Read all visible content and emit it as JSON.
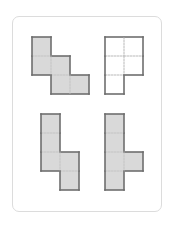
{
  "figure": {
    "cell_size": 19,
    "colors": {
      "card_border": "#dcdcdc",
      "shape_outline": "#6e6e6e",
      "shaded_fill": "#d9d9d9",
      "unshaded_fill": "#ffffff",
      "inner_grid": "#c8c8c8"
    },
    "shapes": [
      {
        "id": "top-left",
        "filled": true,
        "origin": [
          32,
          37
        ],
        "cells": [
          [
            0,
            0
          ],
          [
            0,
            1
          ],
          [
            1,
            1
          ],
          [
            1,
            2
          ],
          [
            2,
            2
          ]
        ]
      },
      {
        "id": "top-right",
        "filled": false,
        "origin": [
          105,
          37
        ],
        "cells": [
          [
            0,
            0
          ],
          [
            1,
            0
          ],
          [
            0,
            1
          ],
          [
            1,
            1
          ],
          [
            0,
            2
          ]
        ]
      },
      {
        "id": "bottom-left",
        "filled": true,
        "origin": [
          41,
          114
        ],
        "cells": [
          [
            0,
            0
          ],
          [
            0,
            1
          ],
          [
            0,
            2
          ],
          [
            1,
            2
          ],
          [
            1,
            3
          ]
        ]
      },
      {
        "id": "bottom-right",
        "filled": true,
        "origin": [
          105,
          114
        ],
        "cells": [
          [
            0,
            0
          ],
          [
            0,
            1
          ],
          [
            0,
            2
          ],
          [
            0,
            3
          ],
          [
            1,
            2
          ]
        ]
      }
    ]
  }
}
